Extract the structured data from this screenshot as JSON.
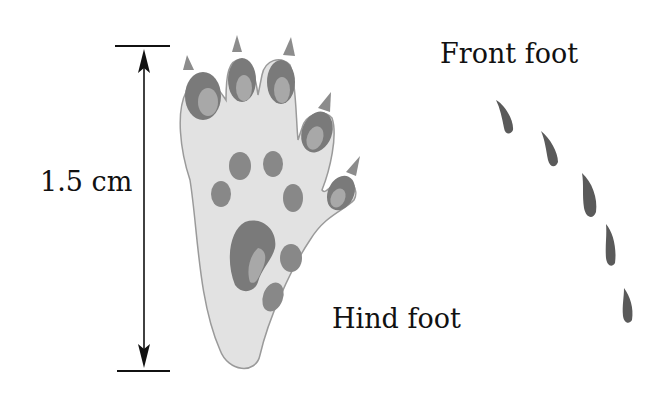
{
  "figure": {
    "scale_label": "1.5 cm",
    "hind_foot_label": "Hind foot",
    "front_foot_label": "Front foot",
    "colors": {
      "line": "#111111",
      "foot_fill": "#e2e2e2",
      "foot_outline": "#9a9a9a",
      "pad_dark": "#7a7a7a",
      "pad_light": "#a8a8a8",
      "claw": "#8c8c8c"
    }
  }
}
